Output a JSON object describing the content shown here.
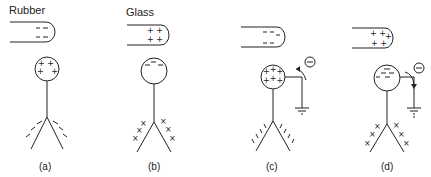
{
  "diagram": {
    "panels": [
      {
        "id": "a",
        "caption": "(a)",
        "rod_label": "Rubber",
        "rod_charge": "negative",
        "rod_symbols": [
          "– –",
          "– –"
        ],
        "knob_charge": "positive",
        "knob_symbols": [
          "+ +",
          "+ +"
        ],
        "leaves_charge": "negative",
        "leaf_symbol": "\\",
        "grounded": false
      },
      {
        "id": "b",
        "caption": "(b)",
        "rod_label": "Glass",
        "rod_charge": "positive",
        "rod_symbols": [
          "+ +",
          "+ +"
        ],
        "knob_charge": "negative",
        "knob_symbols": [
          "–",
          "– –"
        ],
        "leaves_charge": "positive",
        "leaf_symbol": "×",
        "grounded": false
      },
      {
        "id": "c",
        "caption": "(c)",
        "rod_label": "",
        "rod_charge": "negative",
        "rod_symbols": [
          "– –",
          "– –"
        ],
        "knob_charge": "positive",
        "knob_symbols": [
          "+ + +",
          "+ + +"
        ],
        "leaves_charge": "negative",
        "leaf_symbol": "\\",
        "grounded": true,
        "electron_symbol": "–",
        "electron_direction": "to-ground-reversed"
      },
      {
        "id": "d",
        "caption": "(d)",
        "rod_label": "",
        "rod_charge": "positive",
        "rod_symbols": [
          "+ + +",
          "+ +"
        ],
        "knob_charge": "negative",
        "knob_symbols": [
          "– –",
          "– –"
        ],
        "leaves_charge": "positive",
        "leaf_symbol": "×",
        "grounded": true,
        "electron_symbol": "–",
        "electron_direction": "to-ground"
      }
    ]
  }
}
